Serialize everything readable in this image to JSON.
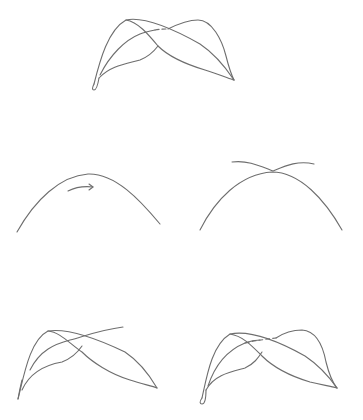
{
  "diagram": {
    "line_color": "#6e6e6e",
    "steps": [
      {
        "step": 1,
        "name": "finished-overlapping-leaves",
        "description": "Final drawing of two crossing leaves"
      },
      {
        "step": 2,
        "name": "draw-arch",
        "description": "Draw an arch with a directional arrow"
      },
      {
        "step": 3,
        "name": "add-crossing-curve",
        "description": "Add a wavy curve crossing the arch top"
      },
      {
        "step": 4,
        "name": "form-first-leaf",
        "description": "Shape the first leaf with its stem"
      },
      {
        "step": 5,
        "name": "form-second-leaf",
        "description": "Complete the second leaf with dashed hidden line"
      }
    ]
  }
}
